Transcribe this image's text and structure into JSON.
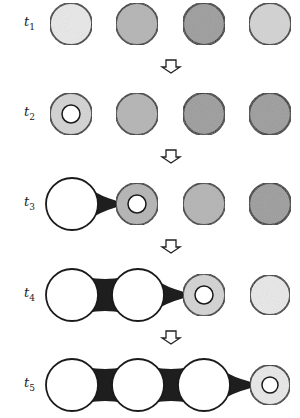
{
  "figure": {
    "type": "time-sequence schematic",
    "colors": {
      "outline": "#1a1a1a",
      "empty_fill": "#ffffff",
      "very_light": "#ececec",
      "light": "#d6d6d6",
      "medium": "#b4b4b4",
      "dark": "#999999",
      "bridge": "#1e1e1e"
    },
    "rows": [
      {
        "label_base": "t",
        "label_sub": "1",
        "y": 24,
        "cells": [
          {
            "x": 71,
            "r": 21,
            "fill": "very_light",
            "ring": false
          },
          {
            "x": 137,
            "r": 21,
            "fill": "medium",
            "ring": false
          },
          {
            "x": 204,
            "r": 21,
            "fill": "dark",
            "ring": false
          },
          {
            "x": 270,
            "r": 21,
            "fill": "light",
            "ring": false
          }
        ]
      },
      {
        "label_base": "t",
        "label_sub": "2",
        "y": 114,
        "cells": [
          {
            "x": 71,
            "r": 21,
            "fill": "light",
            "ring": true
          },
          {
            "x": 137,
            "r": 21,
            "fill": "medium",
            "ring": false
          },
          {
            "x": 204,
            "r": 21,
            "fill": "dark",
            "ring": false
          },
          {
            "x": 270,
            "r": 21,
            "fill": "dark",
            "ring": false
          }
        ]
      },
      {
        "label_base": "t",
        "label_sub": "3",
        "y": 204,
        "cells": [
          {
            "x": 72,
            "r": 26,
            "fill": "empty",
            "ring": false
          },
          {
            "x": 137,
            "r": 21,
            "fill": "medium",
            "ring": true
          },
          {
            "x": 204,
            "r": 21,
            "fill": "medium",
            "ring": false
          },
          {
            "x": 270,
            "r": 21,
            "fill": "dark",
            "ring": false
          }
        ]
      },
      {
        "label_base": "t",
        "label_sub": "4",
        "y": 295,
        "cells": [
          {
            "x": 72,
            "r": 26,
            "fill": "empty",
            "ring": false
          },
          {
            "x": 138,
            "r": 26,
            "fill": "empty",
            "ring": false
          },
          {
            "x": 204,
            "r": 21,
            "fill": "light",
            "ring": true
          },
          {
            "x": 270,
            "r": 20,
            "fill": "very_light",
            "ring": false
          }
        ]
      },
      {
        "label_base": "t",
        "label_sub": "5",
        "y": 385,
        "cells": [
          {
            "x": 72,
            "r": 26,
            "fill": "empty",
            "ring": false
          },
          {
            "x": 138,
            "r": 26,
            "fill": "empty",
            "ring": false
          },
          {
            "x": 204,
            "r": 26,
            "fill": "empty",
            "ring": false
          },
          {
            "x": 270,
            "r": 20,
            "fill": "very_light",
            "ring": true
          }
        ]
      }
    ],
    "arrows": [
      {
        "x": 171,
        "y": 60
      },
      {
        "x": 171,
        "y": 150
      },
      {
        "x": 171,
        "y": 240
      },
      {
        "x": 171,
        "y": 331
      }
    ]
  }
}
